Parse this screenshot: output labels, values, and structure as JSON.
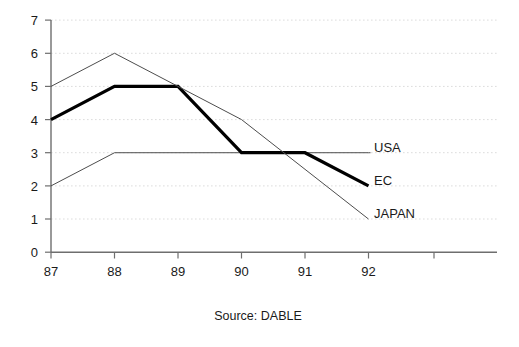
{
  "chart_data": {
    "type": "line",
    "title": "",
    "subtitle": "",
    "xlabel": "",
    "ylabel": "",
    "x": [
      "87",
      "88",
      "89",
      "90",
      "91",
      "92"
    ],
    "categories": [
      "87",
      "88",
      "89",
      "90",
      "91",
      "92"
    ],
    "xlim": [
      87,
      93
    ],
    "ylim": [
      0,
      7
    ],
    "xticks": [
      "87",
      "88",
      "89",
      "90",
      "91",
      "92"
    ],
    "yticks": [
      "0",
      "1",
      "2",
      "3",
      "4",
      "5",
      "6",
      "7"
    ],
    "grid": "horizontal-dotted",
    "legend_position": "right-of-line-ends",
    "series": [
      {
        "name": "USA",
        "values": [
          2,
          3,
          3,
          3,
          3,
          3
        ],
        "style": "thin",
        "color": "#4d4d4d",
        "width": 1,
        "label_x": 93.05,
        "label_y": 3.1,
        "extends_to_x": 92
      },
      {
        "name": "EC",
        "values": [
          4,
          5,
          5,
          3,
          3,
          2
        ],
        "style": "thick",
        "color": "#000000",
        "width": 3.2,
        "label_x": 93.05,
        "label_y": 2.1,
        "extends_to_x": 92
      },
      {
        "name": "JAPAN",
        "values": [
          5,
          6,
          5,
          4,
          2.5,
          1
        ],
        "style": "thin",
        "color": "#4d4d4d",
        "width": 1,
        "label_x": 93.05,
        "label_y": 1.15,
        "extends_to_x": 92
      }
    ],
    "annotations": [
      {
        "name": "source-caption",
        "text": "Source: DABLE"
      }
    ],
    "axis_color": "#666666",
    "gridline_color": "#d9d9d9",
    "extra_unlabeled_xtick": true
  },
  "caption": {
    "source": "Source: DABLE"
  },
  "series_labels": {
    "usa": "USA",
    "ec": "EC",
    "japan": "JAPAN"
  }
}
